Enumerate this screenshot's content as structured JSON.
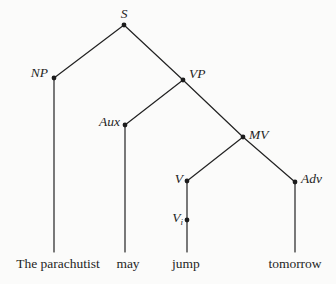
{
  "figure": {
    "background": "#fbfbfa",
    "ink": "#1f1f1f"
  },
  "tree": {
    "nodes": {
      "s": {
        "label": "S"
      },
      "np": {
        "label": "NP"
      },
      "vp": {
        "label": "VP"
      },
      "aux": {
        "label": "Aux"
      },
      "mv": {
        "label": "MV"
      },
      "v": {
        "label": "V"
      },
      "vi": {
        "label": "V",
        "subscript": "i"
      },
      "adv": {
        "label": "Adv"
      }
    },
    "terminals": {
      "np": {
        "word": "The parachutist"
      },
      "aux": {
        "word": "may"
      },
      "v": {
        "word": "jump"
      },
      "adv": {
        "word": "tomorrow"
      }
    }
  }
}
